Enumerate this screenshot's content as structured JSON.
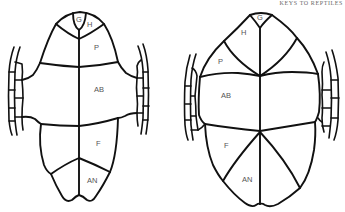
{
  "header": {
    "running_title": "KEYS TO REPTILES"
  },
  "figures": [
    {
      "id": "plastron-left",
      "description": "Plastron with narrow, separated scutes (cruciform-like)",
      "labels": {
        "gular": "G",
        "humeral": "H",
        "pectoral": "P",
        "abdominal": "AB",
        "femoral": "F",
        "anal": "AN"
      }
    },
    {
      "id": "plastron-right",
      "description": "Plastron with broad scutes converging at a central point",
      "labels": {
        "gular": "G",
        "humeral": "H",
        "pectoral": "P",
        "abdominal": "AB",
        "femoral": "F",
        "anal": "AN"
      }
    }
  ],
  "colors": {
    "line": "#111111",
    "label": "#555555",
    "background": "#ffffff"
  }
}
